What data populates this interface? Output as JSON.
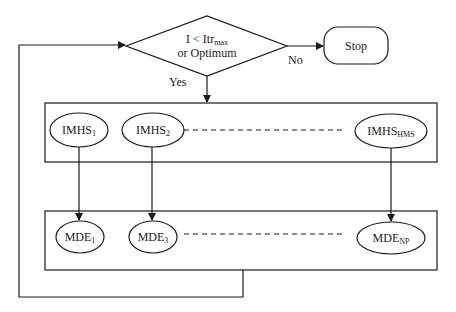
{
  "diagram": {
    "decision": {
      "line1_main": "I < Itr",
      "line1_sub": "max",
      "line2": "or Optimum"
    },
    "terminal": {
      "label": "Stop"
    },
    "edges": {
      "no_label": "No",
      "yes_label": "Yes"
    },
    "upper_group": {
      "nodes": [
        {
          "main": "IMHS",
          "sub": "1"
        },
        {
          "main": "IMHS",
          "sub": "2"
        },
        {
          "main": "IMHS",
          "sub": "HMS"
        }
      ]
    },
    "lower_group": {
      "nodes": [
        {
          "main": "MDE",
          "sub": "1"
        },
        {
          "main": "MDE",
          "sub": "3"
        },
        {
          "main": "MDE",
          "sub": "NP"
        }
      ]
    },
    "colors": {
      "stroke": "#1a1a1a",
      "background": "#ffffff"
    }
  }
}
